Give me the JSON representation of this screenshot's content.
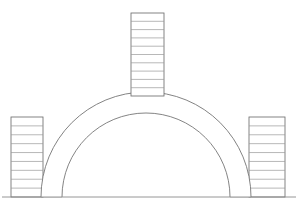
{
  "drawing": {
    "title": "Semicircular masonry arch elevation",
    "type": "architectural-line-drawing",
    "background_color": "#ffffff",
    "line_color": "#8c8c8c",
    "outline_color": "#6e6e6e",
    "canvas": {
      "width": 298,
      "height": 203
    }
  },
  "ground_line": {
    "label": "ground-line",
    "y": 197,
    "x_start": 2,
    "x_end": 296
  },
  "arch": {
    "label": "semicircular-arch",
    "center_x": 146,
    "springing_y": 197,
    "intrados_radius": 84,
    "extrados_radius": 105,
    "ring_thickness": 21,
    "voussoir_count": 40,
    "start_angle_deg": 180,
    "end_angle_deg": 0,
    "crown_extrados_y": 92,
    "crown_intrados_y": 113
  },
  "central_tower": {
    "label": "central-tower",
    "x_left": 131,
    "x_right": 164,
    "y_top": 13,
    "y_bottom": 96,
    "course_count": 10
  },
  "left_pier": {
    "label": "left-pier",
    "x_left": 11,
    "x_right": 43,
    "y_top": 117,
    "y_bottom": 197,
    "course_count": 9
  },
  "right_pier": {
    "label": "right-pier",
    "x_left": 249,
    "x_right": 285,
    "y_top": 117,
    "y_bottom": 197,
    "course_count": 9
  }
}
